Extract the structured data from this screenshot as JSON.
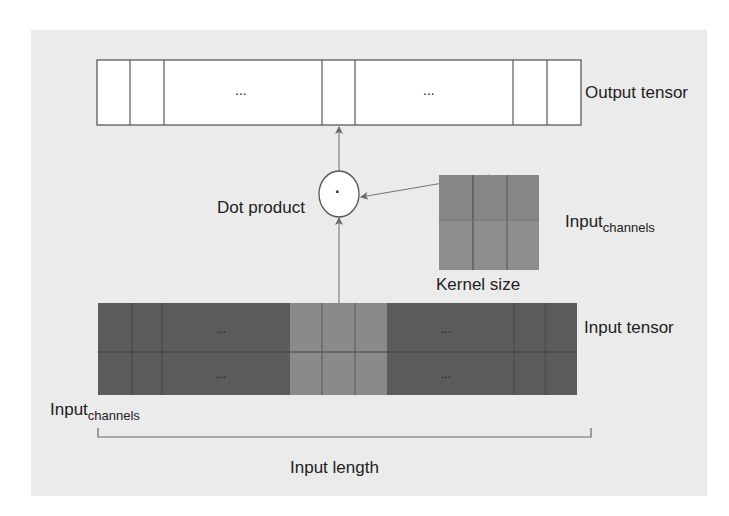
{
  "diagram": {
    "title_labels": {
      "output_tensor": "Output tensor",
      "dot_product": "Dot product",
      "kernel_channels_base": "Input",
      "kernel_channels_sub": "channels",
      "kernel_size": "Kernel size",
      "input_tensor": "Input tensor",
      "input_channels_base": "Input",
      "input_channels_sub": "channels",
      "input_length": "Input length"
    },
    "output_tensor": {
      "cells_ellipsis": [
        "...",
        "..."
      ],
      "operator_symbol": "·"
    },
    "input_tensor": {
      "rows": 2,
      "ellipsis_left_top": "...",
      "ellipsis_left_bottom": "...",
      "ellipsis_right_top": "...",
      "ellipsis_right_bottom": "..."
    },
    "kernel": {
      "rows": 2,
      "cols": 3
    },
    "colors": {
      "panel_bg": "#ebebeb",
      "cell_white": "#ffffff",
      "input_dark": "#5b5b5b",
      "input_highlight": "#8a8a8a",
      "kernel_fill": "#8d8d8d",
      "line": "#555555"
    }
  }
}
